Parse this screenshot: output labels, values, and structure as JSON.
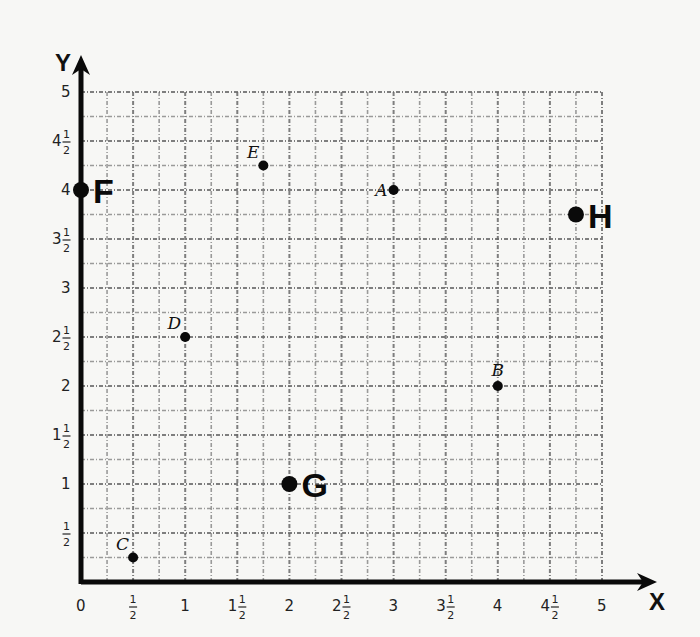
{
  "chart_data": {
    "type": "scatter",
    "title": "",
    "xlabel": "X",
    "ylabel": "Y",
    "xlim": [
      0,
      5
    ],
    "ylim": [
      0,
      5
    ],
    "grid": true,
    "grid_step": 0.25,
    "x_ticks": [
      {
        "value": 0,
        "whole": "0",
        "num": "",
        "den": ""
      },
      {
        "value": 0.5,
        "whole": "",
        "num": "1",
        "den": "2"
      },
      {
        "value": 1,
        "whole": "1",
        "num": "",
        "den": ""
      },
      {
        "value": 1.5,
        "whole": "1",
        "num": "1",
        "den": "2"
      },
      {
        "value": 2,
        "whole": "2",
        "num": "",
        "den": ""
      },
      {
        "value": 2.5,
        "whole": "2",
        "num": "1",
        "den": "2"
      },
      {
        "value": 3,
        "whole": "3",
        "num": "",
        "den": ""
      },
      {
        "value": 3.5,
        "whole": "3",
        "num": "1",
        "den": "2"
      },
      {
        "value": 4,
        "whole": "4",
        "num": "",
        "den": ""
      },
      {
        "value": 4.5,
        "whole": "4",
        "num": "1",
        "den": "2"
      },
      {
        "value": 5,
        "whole": "5",
        "num": "",
        "den": ""
      }
    ],
    "y_ticks": [
      {
        "value": 0.5,
        "whole": "",
        "num": "1",
        "den": "2"
      },
      {
        "value": 1,
        "whole": "1",
        "num": "",
        "den": ""
      },
      {
        "value": 1.5,
        "whole": "1",
        "num": "1",
        "den": "2"
      },
      {
        "value": 2,
        "whole": "2",
        "num": "",
        "den": ""
      },
      {
        "value": 2.5,
        "whole": "2",
        "num": "1",
        "den": "2"
      },
      {
        "value": 3,
        "whole": "3",
        "num": "",
        "den": ""
      },
      {
        "value": 3.5,
        "whole": "3",
        "num": "1",
        "den": "2"
      },
      {
        "value": 4,
        "whole": "4",
        "num": "",
        "den": ""
      },
      {
        "value": 4.5,
        "whole": "4",
        "num": "1",
        "den": "2"
      },
      {
        "value": 5,
        "whole": "5",
        "num": "",
        "den": ""
      }
    ],
    "points": [
      {
        "label": "A",
        "x": 3,
        "y": 4,
        "style": "italic",
        "label_pos": "left"
      },
      {
        "label": "B",
        "x": 4,
        "y": 2,
        "style": "italic",
        "label_pos": "above"
      },
      {
        "label": "C",
        "x": 0.5,
        "y": 0.25,
        "style": "italic",
        "label_pos": "above-left"
      },
      {
        "label": "D",
        "x": 1,
        "y": 2.5,
        "style": "italic",
        "label_pos": "above-left"
      },
      {
        "label": "E",
        "x": 1.75,
        "y": 4.25,
        "style": "italic",
        "label_pos": "above-left"
      },
      {
        "label": "F",
        "x": 0,
        "y": 4,
        "style": "bold",
        "label_pos": "right"
      },
      {
        "label": "G",
        "x": 2,
        "y": 1,
        "style": "bold",
        "label_pos": "right"
      },
      {
        "label": "H",
        "x": 4.75,
        "y": 3.75,
        "style": "bold",
        "label_pos": "right"
      }
    ]
  },
  "layout": {
    "origin_px": [
      81,
      582
    ],
    "unit_px_x": 104.2,
    "unit_px_y": 98,
    "x_arrow_end": 657,
    "y_arrow_end": 55
  },
  "colors": {
    "axis": "#0a0a0a",
    "grid": "#8a8a8a",
    "point": "#0a0a0a",
    "background": "#f7f7f5"
  }
}
